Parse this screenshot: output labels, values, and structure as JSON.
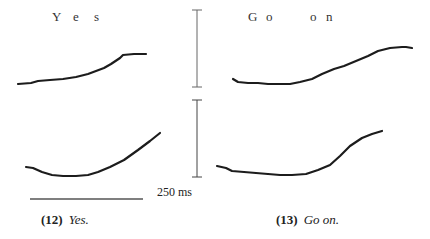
{
  "figure": {
    "panels": [
      {
        "id": "12",
        "caption_number": "(12)",
        "caption_text": "Yes.",
        "syllable_labels": [
          {
            "text": "Y",
            "x": 52,
            "y": 18
          },
          {
            "text": "e",
            "x": 73,
            "y": 18
          },
          {
            "text": "s",
            "x": 95,
            "y": 18
          }
        ],
        "upper_contour": "M18,84 L31,83 L38,81 L50,80 L63,79 L76,77 L88,74 L96,71 L104,68 L111,64 L120,58 L123,55 L134,54 L146,54",
        "lower_contour": "M26,167 L33,168 L42,172 L52,175 L63,176 L76,176 L88,175 L98,172 L110,167 L124,160 L138,150 L150,141 L160,133"
      },
      {
        "id": "13",
        "caption_number": "(13)",
        "caption_text": "Go on.",
        "syllable_labels": [
          {
            "text": "G",
            "x": 248,
            "y": 18
          },
          {
            "text": "o",
            "x": 266,
            "y": 18
          },
          {
            "text": "o",
            "x": 310,
            "y": 18
          },
          {
            "text": "n",
            "x": 326,
            "y": 18
          }
        ],
        "upper_contour": "M233,79 L238,82 L248,83 L258,83 L268,84 L280,84 L290,84 L300,82 L312,79 L322,74 L334,69 L344,66 L356,61 L368,56 L378,51 L390,48 L402,47 L406,47 L412,48",
        "lower_contour": "M217,166 L226,168 L232,171 L244,172 L256,173 L268,174 L280,175 L292,175 L306,174 L318,170 L330,165 L340,156 L350,146 L362,138 L372,134 L382,131"
      }
    ],
    "scale": {
      "time_label": "250 ms",
      "vertical_bar_upper": {
        "x": 197,
        "y1": 10,
        "y2": 87
      },
      "vertical_bar_lower": {
        "x": 197,
        "y1": 100,
        "y2": 177
      },
      "horizontal_bar": {
        "x1": 30,
        "x2": 143,
        "y": 199
      }
    },
    "colors": {
      "contour": "#1c1c1c",
      "scale_bar": "#555555",
      "text": "#222222"
    }
  }
}
